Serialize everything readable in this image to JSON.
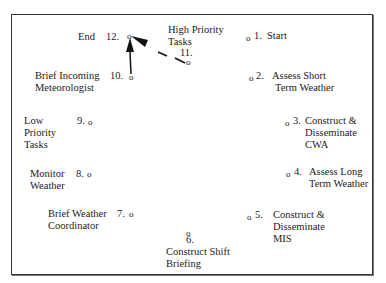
{
  "diagram": {
    "type": "circular task sequence",
    "nodes": [
      {
        "id": 1,
        "num": "1.",
        "label": "Start"
      },
      {
        "id": 2,
        "num": "2.",
        "label_lines": [
          "Assess Short",
          "Term Weather"
        ]
      },
      {
        "id": 3,
        "num": "3.",
        "label_lines": [
          "Construct &",
          "Disseminate",
          "CWA"
        ]
      },
      {
        "id": 4,
        "num": "4.",
        "label_lines": [
          "Assess Long",
          "Term Weather"
        ]
      },
      {
        "id": 5,
        "num": "5.",
        "label_lines": [
          "Construct &",
          "Disseminate",
          "MIS"
        ]
      },
      {
        "id": 6,
        "num": "6.",
        "label_lines": [
          "Construct Shift",
          "Briefing"
        ]
      },
      {
        "id": 7,
        "num": "7.",
        "label_lines": [
          "Brief Weather",
          "Coordinator"
        ]
      },
      {
        "id": 8,
        "num": "8.",
        "label_lines": [
          "Monitor",
          "Weather"
        ]
      },
      {
        "id": 9,
        "num": "9.",
        "label_lines": [
          "Low",
          "Priority",
          "Tasks"
        ]
      },
      {
        "id": 10,
        "num": "10.",
        "label_lines": [
          "Brief Incoming",
          "Meteorologist"
        ]
      },
      {
        "id": 11,
        "num": "11.",
        "label_lines": [
          "High Priority",
          "Tasks"
        ]
      },
      {
        "id": 12,
        "num": "12.",
        "label": "End"
      }
    ],
    "node_marker": "o",
    "arrows": [
      {
        "from": 10,
        "to": 12,
        "style": "solid"
      },
      {
        "from": 11,
        "to": 12,
        "style": "dashed"
      }
    ]
  }
}
